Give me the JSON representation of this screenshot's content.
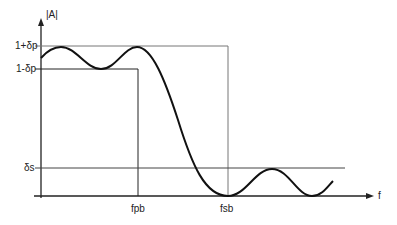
{
  "diagram": {
    "type": "lowpass-filter-specification",
    "y_axis_label": "|A|",
    "x_axis_label": "f",
    "y_ticks": {
      "upper_passband": "1+δp",
      "lower_passband": "1-δp",
      "stopband": "δs"
    },
    "x_ticks": {
      "passband_edge": "fpb",
      "stopband_edge": "fsb"
    }
  }
}
